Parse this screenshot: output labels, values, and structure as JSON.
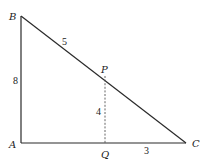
{
  "diagram": {
    "type": "right-triangle-geometry",
    "points": {
      "A": {
        "label": "A",
        "x": 21,
        "y": 143
      },
      "B": {
        "label": "B",
        "x": 21,
        "y": 16
      },
      "C": {
        "label": "C",
        "x": 186,
        "y": 143
      },
      "P": {
        "label": "P",
        "x": 105,
        "y": 76
      },
      "Q": {
        "label": "Q",
        "x": 105,
        "y": 143
      }
    },
    "segments": [
      {
        "from": "A",
        "to": "B",
        "style": "solid"
      },
      {
        "from": "A",
        "to": "C",
        "style": "solid"
      },
      {
        "from": "B",
        "to": "C",
        "style": "solid"
      },
      {
        "from": "P",
        "to": "Q",
        "style": "dashed"
      }
    ],
    "measurements": {
      "BP": "5",
      "AB": "8",
      "PQ": "4",
      "QC": "3"
    },
    "colors": {
      "line": "#2a2a2a",
      "dashed": "#555555",
      "text": "#222222",
      "background": "#ffffff"
    }
  }
}
